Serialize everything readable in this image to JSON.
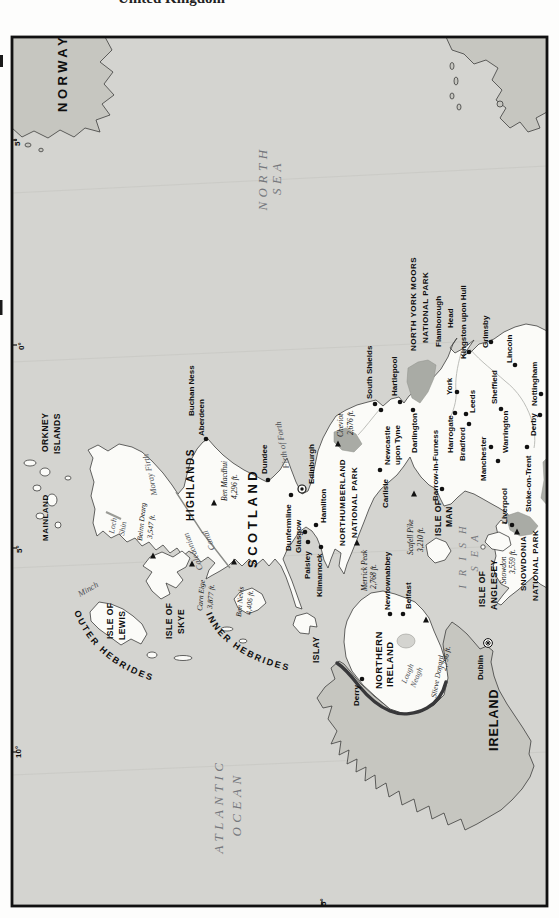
{
  "page": {
    "title_fragment": "United Kingdom"
  },
  "map": {
    "colors": {
      "sea": "#d4d4d0",
      "foreign_land": "#c6c6c0",
      "uk_land": "#fbfbf8",
      "park_patch": "#a9aba5",
      "frame": "#111111"
    },
    "countries": [
      {
        "id": "norway",
        "cls": "c-bold",
        "fs": 13,
        "ls": 3.5,
        "lines": [
          {
            "t": "NORWAY",
            "x": 67,
            "y": 112
          }
        ]
      },
      {
        "id": "scotland",
        "cls": "c-bold",
        "fs": 13,
        "ls": 3.5,
        "lines": [
          {
            "t": "SCOTLAND",
            "x": 257,
            "y": 568
          }
        ]
      },
      {
        "id": "northern-ireland",
        "cls": "c-bold",
        "fs": 9.5,
        "ls": 0.5,
        "lines": [
          {
            "t": "NORTHERN",
            "x": 382,
            "y": 689
          },
          {
            "t": "IRELAND",
            "x": 393,
            "y": 687
          }
        ]
      },
      {
        "id": "ireland",
        "cls": "c-bold",
        "fs": 12.5,
        "ls": 1,
        "lines": [
          {
            "t": "IRELAND",
            "x": 498,
            "y": 751
          }
        ]
      }
    ],
    "regions": [
      {
        "id": "highlands",
        "cls": "c-bold",
        "fs": 10,
        "ls": 1.5,
        "lines": [
          {
            "t": "HIGHLANDS",
            "x": 194,
            "y": 521
          }
        ]
      },
      {
        "id": "orkney-islands",
        "cls": "c-bold",
        "fs": 8.5,
        "ls": 0.5,
        "lines": [
          {
            "t": "ORKNEY",
            "x": 48,
            "y": 452
          },
          {
            "t": "ISLANDS",
            "x": 60,
            "y": 454
          }
        ]
      },
      {
        "id": "orkney-mainland",
        "cls": "c-bold",
        "fs": 8,
        "ls": 0.5,
        "lines": [
          {
            "t": "MAINLAND",
            "x": 48,
            "y": 541
          }
        ]
      }
    ],
    "islands": [
      {
        "id": "isle-of-lewis",
        "cls": "c-bold",
        "fs": 8.5,
        "ls": 0.5,
        "lines": [
          {
            "t": "ISLE OF",
            "x": 113,
            "y": 639
          },
          {
            "t": "LEWIS",
            "x": 125,
            "y": 640
          }
        ]
      },
      {
        "id": "isle-of-skye",
        "cls": "c-bold",
        "fs": 8.5,
        "ls": 0.5,
        "lines": [
          {
            "t": "ISLE OF",
            "x": 172,
            "y": 639
          },
          {
            "t": "SKYE",
            "x": 184,
            "y": 634
          }
        ]
      },
      {
        "id": "islay",
        "cls": "c-bold",
        "fs": 8.5,
        "ls": 0.5,
        "lines": [
          {
            "t": "ISLAY",
            "x": 319,
            "y": 663
          }
        ]
      },
      {
        "id": "isle-of-man",
        "cls": "c-bold",
        "fs": 8.5,
        "ls": 0.5,
        "lines": [
          {
            "t": "ISLE OF",
            "x": 441,
            "y": 536
          },
          {
            "t": "MAN",
            "x": 452,
            "y": 527
          }
        ]
      },
      {
        "id": "isle-of-anglesey",
        "cls": "c-bold",
        "fs": 8.5,
        "ls": 0.5,
        "lines": [
          {
            "t": "ISLE OF",
            "x": 485,
            "y": 607
          },
          {
            "t": "ANGLESEY",
            "x": 497,
            "y": 610
          }
        ]
      },
      {
        "id": "outer-hebrides",
        "cls": "c-bold",
        "fs": 9,
        "ls": 2,
        "path": "M 74,612 Q 95,667 166,685",
        "lines": [
          {
            "t": "OUTER HEBRIDES",
            "x": 0,
            "y": 0
          }
        ]
      },
      {
        "id": "inner-hebrides",
        "cls": "c-bold",
        "fs": 9,
        "ls": 2,
        "path": "M 206,614 Q 224,657 294,672",
        "lines": [
          {
            "t": "INNER HEBRIDES",
            "x": 0,
            "y": 0
          }
        ]
      }
    ],
    "seas": [
      {
        "id": "north-sea",
        "cls": "c-sea",
        "fs": 13,
        "ls": 4.5,
        "anchor": "middle",
        "lines": [
          {
            "t": "NORTH",
            "x": 267,
            "y": 178
          },
          {
            "t": "SEA",
            "x": 281,
            "y": 177
          }
        ]
      },
      {
        "id": "atlantic-ocean",
        "cls": "c-sea",
        "fs": 13,
        "ls": 4.5,
        "anchor": "middle",
        "lines": [
          {
            "t": "ATLANTIC",
            "x": 223,
            "y": 806
          },
          {
            "t": "OCEAN",
            "x": 241,
            "y": 804
          }
        ]
      },
      {
        "id": "irish-sea",
        "cls": "c-sea",
        "fs": 10.5,
        "ls": 9,
        "anchor": "middle",
        "lines": [
          {
            "t": "IRISH",
            "x": 466,
            "y": 553
          },
          {
            "t": "SEA",
            "x": 478,
            "y": 549
          }
        ]
      }
    ],
    "water": [
      {
        "id": "minch",
        "cls": "c-water",
        "fs": 8.5,
        "rot": -30,
        "lines": [
          {
            "t": "Minch",
            "x": 80,
            "y": 597
          }
        ]
      },
      {
        "id": "moray-firth",
        "cls": "c-water",
        "fs": 8.5,
        "rot": -102,
        "lines": [
          {
            "t": "Moray Firth",
            "x": 157,
            "y": 495
          }
        ]
      },
      {
        "id": "firth-of-forth",
        "cls": "c-water",
        "fs": 8.5,
        "rot": -100,
        "lines": [
          {
            "t": "Firth of Forth",
            "x": 289,
            "y": 468
          }
        ]
      },
      {
        "id": "caledonian-canal",
        "cls": "c-water",
        "fs": 8.5,
        "rot": -112,
        "lines": [
          {
            "t": "Caledonian",
            "x": 203,
            "y": 569
          }
        ]
      },
      {
        "id": "caledonian-canal-2",
        "cls": "c-water",
        "fs": 8.5,
        "rot": -112,
        "lines": [
          {
            "t": "Canal",
            "x": 215,
            "y": 549
          }
        ]
      },
      {
        "id": "loch-shin",
        "cls": "c-water",
        "fs": 8,
        "rot": -80,
        "lines": [
          {
            "t": "Loch",
            "x": 114,
            "y": 534
          },
          {
            "t": "Shin",
            "x": 124,
            "y": 536
          }
        ]
      },
      {
        "id": "lough-neagh",
        "cls": "c-water",
        "fs": 8,
        "rot": -68,
        "lines": [
          {
            "t": "Lough",
            "x": 406,
            "y": 684
          },
          {
            "t": "Neagh",
            "x": 415,
            "y": 688
          }
        ]
      }
    ],
    "parks": [
      {
        "id": "northumberland-national-park",
        "cls": "c-bold",
        "fs": 8,
        "ls": 0.5,
        "lines": [
          {
            "t": "NORTHUMBERLAND",
            "x": 345,
            "y": 546
          },
          {
            "t": "NATIONAL PARK",
            "x": 357,
            "y": 538
          }
        ]
      },
      {
        "id": "north-york-moors-national-park",
        "cls": "c-bold",
        "fs": 8,
        "ls": 0.5,
        "lines": [
          {
            "t": "NORTH YORK MOORS",
            "x": 416,
            "y": 351
          },
          {
            "t": "NATIONAL PARK",
            "x": 428,
            "y": 343
          }
        ]
      },
      {
        "id": "snowdonia-national-park",
        "cls": "c-bold",
        "fs": 8,
        "ls": 0.5,
        "lines": [
          {
            "t": "SNOWDONIA",
            "x": 526,
            "y": 591
          },
          {
            "t": "NATIONAL PARK",
            "x": 538,
            "y": 601
          }
        ]
      }
    ],
    "headlands": [
      {
        "id": "buchan-ness",
        "cls": "c-bold",
        "fs": 8,
        "lines": [
          {
            "t": "Buchan Ness",
            "x": 194,
            "y": 416
          }
        ]
      },
      {
        "id": "flamborough-head",
        "cls": "c-bold",
        "fs": 8,
        "lines": [
          {
            "t": "Flamborough",
            "x": 441,
            "y": 347
          },
          {
            "t": "Head",
            "x": 453,
            "y": 328
          }
        ]
      }
    ],
    "grid": [
      {
        "id": "lon-5e",
        "cls": "c-bold",
        "fs": 8,
        "lines": [
          {
            "t": "5°",
            "x": 20,
            "y": 146
          }
        ]
      },
      {
        "id": "lon-0",
        "cls": "c-bold",
        "fs": 8,
        "lines": [
          {
            "t": "0°",
            "x": 24,
            "y": 350
          }
        ]
      },
      {
        "id": "lon-5w",
        "cls": "c-bold",
        "fs": 8,
        "lines": [
          {
            "t": "5°",
            "x": 22,
            "y": 553
          }
        ]
      },
      {
        "id": "lon-10w",
        "cls": "c-bold",
        "fs": 8,
        "lines": [
          {
            "t": "10°",
            "x": 21,
            "y": 758
          }
        ]
      },
      {
        "id": "lat-55",
        "cls": "c-bold",
        "fs": 8,
        "lines": [
          {
            "t": "5°",
            "x": 326,
            "y": 906
          }
        ]
      }
    ],
    "cities": [
      {
        "name": "Aberdeen",
        "symbol": "dot",
        "dot_x": 206,
        "dot_y": 439,
        "lines": [
          {
            "t": "Aberdeen",
            "x": 204,
            "y": 436
          }
        ]
      },
      {
        "name": "Dundee",
        "symbol": "dot",
        "dot_x": 268,
        "dot_y": 480,
        "lines": [
          {
            "t": "Dundee",
            "x": 267,
            "y": 474
          }
        ]
      },
      {
        "name": "Edinburgh",
        "symbol": "capital-ring",
        "dot_x": 302,
        "dot_y": 489,
        "lines": [
          {
            "t": "Edinburgh",
            "x": 314,
            "y": 484
          }
        ]
      },
      {
        "name": "Dunfermline",
        "symbol": "dot",
        "dot_x": 291,
        "dot_y": 495,
        "lines": [
          {
            "t": "Dunfermline",
            "x": 291,
            "y": 551
          }
        ]
      },
      {
        "name": "Glasgow",
        "symbol": "dot",
        "dot_x": 305,
        "dot_y": 532,
        "lines": [
          {
            "t": "Glasgow",
            "x": 301,
            "y": 553
          }
        ]
      },
      {
        "name": "Hamilton",
        "symbol": "dot",
        "dot_x": 316,
        "dot_y": 525,
        "lines": [
          {
            "t": "Hamilton",
            "x": 326,
            "y": 523
          }
        ]
      },
      {
        "name": "Paisley",
        "symbol": "dot",
        "dot_x": 308,
        "dot_y": 542,
        "lines": [
          {
            "t": "Paisley",
            "x": 310,
            "y": 579
          }
        ]
      },
      {
        "name": "Kilmarnock",
        "symbol": "dot",
        "dot_x": 321,
        "dot_y": 547,
        "lines": [
          {
            "t": "Kilmarnock",
            "x": 322,
            "y": 597
          }
        ]
      },
      {
        "name": "Derry",
        "symbol": "dot",
        "dot_x": 362,
        "dot_y": 679,
        "lines": [
          {
            "t": "Derry",
            "x": 359,
            "y": 706
          }
        ]
      },
      {
        "name": "Newtownabbey",
        "symbol": "dot",
        "dot_x": 390,
        "dot_y": 614,
        "lines": [
          {
            "t": "Newtownabbey",
            "x": 390,
            "y": 610
          }
        ]
      },
      {
        "name": "Belfast",
        "symbol": "dot",
        "dot_x": 403,
        "dot_y": 614,
        "lines": [
          {
            "t": "Belfast",
            "x": 411,
            "y": 609
          }
        ]
      },
      {
        "name": "Carlisle",
        "symbol": "dot",
        "dot_x": 380,
        "dot_y": 470,
        "lines": [
          {
            "t": "Carlisle",
            "x": 388,
            "y": 508
          }
        ]
      },
      {
        "name": "Newcastle upon Tyne",
        "symbol": "dot",
        "dot_x": 381,
        "dot_y": 410,
        "lines": [
          {
            "t": "Newcastle",
            "x": 390,
            "y": 465
          },
          {
            "t": "upon Tyne",
            "x": 400,
            "y": 465
          }
        ]
      },
      {
        "name": "South Shields",
        "symbol": "dot",
        "dot_x": 375,
        "dot_y": 404,
        "lines": [
          {
            "t": "South Shields",
            "x": 372,
            "y": 399
          }
        ]
      },
      {
        "name": "Hartlepool",
        "symbol": "dot",
        "dot_x": 400,
        "dot_y": 402,
        "lines": [
          {
            "t": "Hartlepool",
            "x": 397,
            "y": 396
          }
        ]
      },
      {
        "name": "Darlington",
        "symbol": "dot",
        "dot_x": 413,
        "dot_y": 410,
        "lines": [
          {
            "t": "Darlington",
            "x": 417,
            "y": 453
          }
        ]
      },
      {
        "name": "Barrow-in-Furness",
        "symbol": "dot",
        "dot_x": 442,
        "dot_y": 489,
        "lines": [
          {
            "t": "Barrow-in-Furness",
            "x": 438,
            "y": 501
          }
        ]
      },
      {
        "name": "York",
        "symbol": "dot",
        "dot_x": 457,
        "dot_y": 392,
        "lines": [
          {
            "t": "York",
            "x": 452,
            "y": 395
          }
        ]
      },
      {
        "name": "Harrogate",
        "symbol": "dot",
        "dot_x": 455,
        "dot_y": 413,
        "lines": [
          {
            "t": "Harrogate",
            "x": 453,
            "y": 453
          }
        ]
      },
      {
        "name": "Bradford",
        "symbol": "dot",
        "dot_x": 469,
        "dot_y": 424,
        "lines": [
          {
            "t": "Bradford",
            "x": 465,
            "y": 461
          }
        ]
      },
      {
        "name": "Leeds",
        "symbol": "dot",
        "dot_x": 466,
        "dot_y": 414,
        "lines": [
          {
            "t": "Leeds",
            "x": 475,
            "y": 413
          }
        ]
      },
      {
        "name": "Kingston upon Hull",
        "symbol": "dot",
        "dot_x": 469,
        "dot_y": 352,
        "lines": [
          {
            "t": "Kingston upon Hull",
            "x": 466,
            "y": 359
          }
        ]
      },
      {
        "name": "Grimsby",
        "symbol": "dot",
        "dot_x": 491,
        "dot_y": 342,
        "lines": [
          {
            "t": "Grimsby",
            "x": 488,
            "y": 348
          }
        ]
      },
      {
        "name": "Lincoln",
        "symbol": "dot",
        "dot_x": 515,
        "dot_y": 365,
        "lines": [
          {
            "t": "Lincoln",
            "x": 512,
            "y": 363
          }
        ]
      },
      {
        "name": "Sheffield",
        "symbol": "dot",
        "dot_x": 501,
        "dot_y": 409,
        "lines": [
          {
            "t": "Sheffield",
            "x": 497,
            "y": 404
          }
        ]
      },
      {
        "name": "Nottingham",
        "symbol": "dot",
        "dot_x": 541,
        "dot_y": 394,
        "lines": [
          {
            "t": "Nottingham",
            "x": 537,
            "y": 406
          }
        ]
      },
      {
        "name": "Derby",
        "symbol": "dot",
        "dot_x": 540,
        "dot_y": 415,
        "lines": [
          {
            "t": "Derby",
            "x": 536,
            "y": 436
          }
        ]
      },
      {
        "name": "Manchester",
        "symbol": "dot",
        "dot_x": 491,
        "dot_y": 447,
        "lines": [
          {
            "t": "Manchester",
            "x": 486,
            "y": 481
          }
        ]
      },
      {
        "name": "Warrington",
        "symbol": "dot",
        "dot_x": 498,
        "dot_y": 461,
        "lines": [
          {
            "t": "Warrington",
            "x": 508,
            "y": 453
          }
        ]
      },
      {
        "name": "Liverpool",
        "symbol": "dot",
        "dot_x": 512,
        "dot_y": 525,
        "lines": [
          {
            "t": "Liverpool",
            "x": 507,
            "y": 524
          }
        ]
      },
      {
        "name": "Stoke-on-Trent",
        "symbol": "dot",
        "dot_x": 527,
        "dot_y": 447,
        "lines": [
          {
            "t": "Stoke-on-Trent",
            "x": 531,
            "y": 512
          }
        ]
      },
      {
        "name": "Dublin",
        "symbol": "capital-star",
        "dot_x": 488,
        "dot_y": 643,
        "lines": [
          {
            "t": "Dublin",
            "x": 483,
            "y": 680
          }
        ]
      }
    ],
    "mountains": [
      {
        "name": "Beinn Dearg",
        "elevation": "3,547 ft.",
        "nx": 142,
        "ny": 541,
        "ex": 152,
        "ey": 539,
        "rot": -84,
        "tx": 153,
        "ty": 556
      },
      {
        "name": "Ben Macdhui",
        "elevation": "4,296 ft.",
        "nx": 227,
        "ny": 501,
        "ex": 237,
        "ey": 499,
        "rot": -90,
        "tx": 214,
        "ty": 503
      },
      {
        "name": "Carn Eige",
        "elevation": "3,877 ft.",
        "nx": 202,
        "ny": 611,
        "ex": 212,
        "ey": 609,
        "rot": -85,
        "tx": 192,
        "ty": 564
      },
      {
        "name": "Ben Nevis",
        "elevation": "4,406 ft.",
        "nx": 241,
        "ny": 617,
        "ex": 251,
        "ey": 615,
        "rot": -85,
        "tx": 234,
        "ty": 562
      },
      {
        "name": "Merrick Peak",
        "elevation": "2,768 ft.",
        "nx": 367,
        "ny": 591,
        "ex": 376,
        "ey": 589,
        "rot": -90,
        "tx": 357,
        "ty": 543
      },
      {
        "name": "Cheviot",
        "elevation": "2,676 ft.",
        "nx": 343,
        "ny": 437,
        "ex": 353,
        "ey": 435,
        "rot": -90,
        "tx": 338,
        "ty": 444
      },
      {
        "name": "Scafell Pike",
        "elevation": "3,210 ft.",
        "nx": 413,
        "ny": 555,
        "ex": 423,
        "ey": 552,
        "rot": -90,
        "tx": 414,
        "ty": 494
      },
      {
        "name": "Snowdon",
        "elevation": "3,559 ft.",
        "nx": 506,
        "ny": 584,
        "ex": 515,
        "ey": 574,
        "rot": -90,
        "tx": 517,
        "ty": 532
      },
      {
        "name": "Slieve Donard",
        "elevation": "2,796 ft.",
        "nx": 436,
        "ny": 698,
        "ex": 446,
        "ey": 671,
        "rot": -80,
        "tx": 426,
        "ty": 620
      }
    ]
  }
}
